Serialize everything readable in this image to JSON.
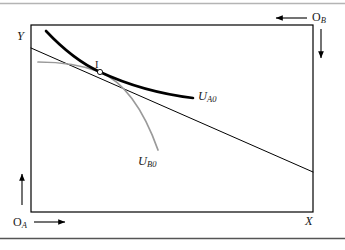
{
  "figure": {
    "kind": "edgeworth-box-diagram",
    "background_color": "#ffffff",
    "rules": {
      "top_rule_color": "#b4b4b4",
      "bottom_rule_color": "#555555"
    },
    "box": {
      "left": 31,
      "top": 25,
      "right": 313,
      "bottom": 212,
      "stroke": "#000000",
      "stroke_width": 1.2
    },
    "axes": {
      "y_label": "Y",
      "x_label": "X",
      "origin_a_label": "O",
      "origin_a_sub": "A",
      "origin_b_label": "O",
      "origin_b_sub": "B"
    },
    "arrows": {
      "origin_a_up": {
        "from": [
          22,
          205
        ],
        "to": [
          22,
          172
        ],
        "color": "#000000"
      },
      "origin_a_right": {
        "from": [
          34,
          222
        ],
        "to": [
          67,
          222
        ],
        "color": "#000000"
      },
      "origin_b_left": {
        "from": [
          306,
          18
        ],
        "to": [
          274,
          18
        ],
        "color": "#000000"
      },
      "origin_b_down": {
        "from": [
          321,
          28
        ],
        "to": [
          321,
          60
        ],
        "color": "#000000"
      }
    },
    "point": {
      "label": "I",
      "x": 100,
      "y": 72,
      "marker": "open-circle",
      "marker_radius": 2.6,
      "marker_fill": "#ffffff",
      "marker_stroke": "#000000"
    },
    "curves": [
      {
        "name": "indifference-curve-a",
        "label_text": "U",
        "label_sub": "A0",
        "color": "#000000",
        "stroke_width": 2.6,
        "path": "M 46,31 C 62,48 78,62 100,72 C 128,85 160,94 193,98"
      },
      {
        "name": "indifference-curve-b",
        "label_text": "U",
        "label_sub": "B0",
        "color": "#9a9a9a",
        "stroke_width": 1.7,
        "path": "M 38,62 C 58,62 82,65 100,72 C 124,82 143,108 158,150"
      },
      {
        "name": "price-line",
        "label_text": "",
        "label_sub": "",
        "color": "#000000",
        "stroke_width": 1.0,
        "path": "M 31,48 L 313,172"
      }
    ]
  }
}
